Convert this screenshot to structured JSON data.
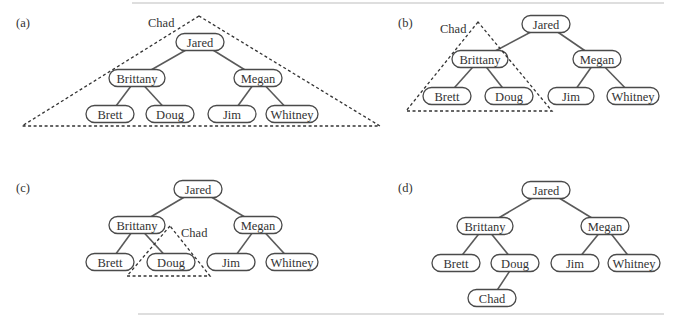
{
  "figure": {
    "node_names": [
      "Jared",
      "Brittany",
      "Megan",
      "Brett",
      "Doug",
      "Jim",
      "Whitney",
      "Chad"
    ]
  },
  "panels": [
    {
      "label": "(a)",
      "label_pos": [
        16,
        27
      ],
      "nodes": [
        {
          "id": "Jared",
          "text": "Jared",
          "x": 200,
          "y": 42,
          "w": 48
        },
        {
          "id": "Brittany",
          "text": "Brittany",
          "x": 137,
          "y": 78,
          "w": 56
        },
        {
          "id": "Megan",
          "text": "Megan",
          "x": 258,
          "y": 78,
          "w": 48
        },
        {
          "id": "Brett",
          "text": "Brett",
          "x": 110,
          "y": 114,
          "w": 48
        },
        {
          "id": "Doug",
          "text": "Doug",
          "x": 170,
          "y": 114,
          "w": 48
        },
        {
          "id": "Jim",
          "text": "Jim",
          "x": 232,
          "y": 114,
          "w": 48
        },
        {
          "id": "Whitney",
          "text": "Whitney",
          "x": 292,
          "y": 114,
          "w": 52
        }
      ],
      "edges": [
        [
          "Jared",
          "Brittany"
        ],
        [
          "Jared",
          "Megan"
        ],
        [
          "Brittany",
          "Brett"
        ],
        [
          "Brittany",
          "Doug"
        ],
        [
          "Megan",
          "Jim"
        ],
        [
          "Megan",
          "Whitney"
        ]
      ],
      "triangle": {
        "points": [
          [
            199,
            16
          ],
          [
            22,
            126
          ],
          [
            380,
            126
          ]
        ],
        "label": "Chad",
        "label_pos": [
          148,
          27
        ]
      }
    },
    {
      "label": "(b)",
      "label_pos": [
        398,
        27
      ],
      "nodes": [
        {
          "id": "Jared",
          "text": "Jared",
          "x": 546,
          "y": 24,
          "w": 48
        },
        {
          "id": "Brittany",
          "text": "Brittany",
          "x": 480,
          "y": 59,
          "w": 56
        },
        {
          "id": "Megan",
          "text": "Megan",
          "x": 597,
          "y": 59,
          "w": 48
        },
        {
          "id": "Brett",
          "text": "Brett",
          "x": 447,
          "y": 96,
          "w": 48
        },
        {
          "id": "Doug",
          "text": "Doug",
          "x": 509,
          "y": 96,
          "w": 48
        },
        {
          "id": "Jim",
          "text": "Jim",
          "x": 571,
          "y": 96,
          "w": 46
        },
        {
          "id": "Whitney",
          "text": "Whitney",
          "x": 633,
          "y": 96,
          "w": 52
        }
      ],
      "edges": [
        [
          "Jared",
          "Brittany"
        ],
        [
          "Jared",
          "Megan"
        ],
        [
          "Brittany",
          "Brett"
        ],
        [
          "Brittany",
          "Doug"
        ],
        [
          "Megan",
          "Jim"
        ],
        [
          "Megan",
          "Whitney"
        ]
      ],
      "triangle": {
        "points": [
          [
            478,
            22
          ],
          [
            406,
            111
          ],
          [
            552,
            111
          ]
        ],
        "label": "Chad",
        "label_pos": [
          440,
          33
        ]
      }
    },
    {
      "label": "(c)",
      "label_pos": [
        16,
        192
      ],
      "nodes": [
        {
          "id": "Jared",
          "text": "Jared",
          "x": 198,
          "y": 189,
          "w": 48
        },
        {
          "id": "Brittany",
          "text": "Brittany",
          "x": 137,
          "y": 225,
          "w": 56
        },
        {
          "id": "Megan",
          "text": "Megan",
          "x": 258,
          "y": 225,
          "w": 48
        },
        {
          "id": "Brett",
          "text": "Brett",
          "x": 110,
          "y": 262,
          "w": 48
        },
        {
          "id": "Doug",
          "text": "Doug",
          "x": 171,
          "y": 262,
          "w": 48
        },
        {
          "id": "Jim",
          "text": "Jim",
          "x": 231,
          "y": 262,
          "w": 48
        },
        {
          "id": "Whitney",
          "text": "Whitney",
          "x": 292,
          "y": 262,
          "w": 52
        }
      ],
      "edges": [
        [
          "Jared",
          "Brittany"
        ],
        [
          "Jared",
          "Megan"
        ],
        [
          "Brittany",
          "Brett"
        ],
        [
          "Brittany",
          "Doug"
        ],
        [
          "Megan",
          "Jim"
        ],
        [
          "Megan",
          "Whitney"
        ]
      ],
      "triangle": {
        "points": [
          [
            170,
            226
          ],
          [
            127,
            276
          ],
          [
            210,
            276
          ]
        ],
        "label": "Chad",
        "label_pos": [
          181,
          237
        ]
      }
    },
    {
      "label": "(d)",
      "label_pos": [
        398,
        192
      ],
      "nodes": [
        {
          "id": "Jared",
          "text": "Jared",
          "x": 546,
          "y": 190,
          "w": 48
        },
        {
          "id": "Brittany",
          "text": "Brittany",
          "x": 485,
          "y": 226,
          "w": 56
        },
        {
          "id": "Megan",
          "text": "Megan",
          "x": 605,
          "y": 226,
          "w": 48
        },
        {
          "id": "Brett",
          "text": "Brett",
          "x": 456,
          "y": 263,
          "w": 48
        },
        {
          "id": "Doug",
          "text": "Doug",
          "x": 515,
          "y": 263,
          "w": 48
        },
        {
          "id": "Jim",
          "text": "Jim",
          "x": 575,
          "y": 263,
          "w": 48
        },
        {
          "id": "Whitney",
          "text": "Whitney",
          "x": 634,
          "y": 263,
          "w": 52
        },
        {
          "id": "Chad",
          "text": "Chad",
          "x": 492,
          "y": 298,
          "w": 48
        }
      ],
      "edges": [
        [
          "Jared",
          "Brittany"
        ],
        [
          "Jared",
          "Megan"
        ],
        [
          "Brittany",
          "Brett"
        ],
        [
          "Brittany",
          "Doug"
        ],
        [
          "Megan",
          "Jim"
        ],
        [
          "Megan",
          "Whitney"
        ],
        [
          "Doug",
          "Chad"
        ]
      ],
      "triangle": null
    }
  ],
  "rules": [
    {
      "x1": 132,
      "y1": 3,
      "x2": 664,
      "y2": 3
    },
    {
      "x1": 138,
      "y1": 314,
      "x2": 664,
      "y2": 314
    }
  ],
  "colors": {
    "stroke": "#4a4a4a",
    "text": "#333333",
    "rule": "#bdbdbd"
  }
}
